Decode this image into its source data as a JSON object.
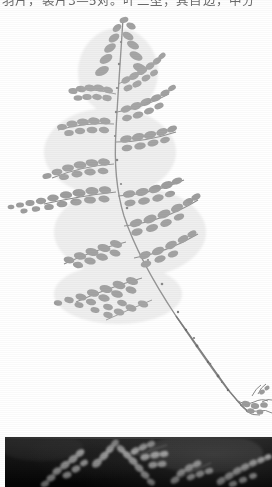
{
  "page": {
    "background_color": "#ffffff",
    "width": 272,
    "height": 487
  },
  "text": {
    "clipped_line": "羽片，裂片3—5对。叶二型；其自边，中分",
    "note": "line is cropped at top of scan; only lower halves of glyphs are visible",
    "color": "#4a4a4a"
  },
  "figures": [
    {
      "id": "fern-specimen-light",
      "caption": "",
      "description": "herbarium specimen of a finely divided fern frond, pale gray on white background, rachis descending diagonally to lower right ending in a rhizome with roots",
      "background_color": "#ffffff",
      "ink_color": "#9a9a9a"
    },
    {
      "id": "fern-detail-dark",
      "caption": "",
      "description": "close-up photograph of pale branching fern pinnae against a black background",
      "background_color": "#0b0b0b",
      "ink_color": "#d8d8d8"
    }
  ]
}
